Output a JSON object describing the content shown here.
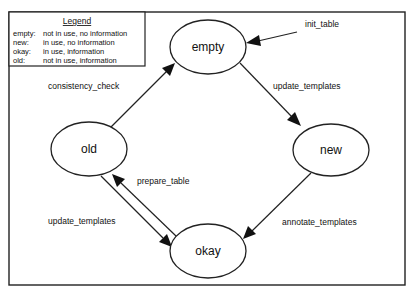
{
  "legend": {
    "title": "Legend",
    "entries": [
      {
        "key": "empty:",
        "desc": "not in use, no information"
      },
      {
        "key": "new:",
        "desc": "in use, no information"
      },
      {
        "key": "okay:",
        "desc": "in use, information"
      },
      {
        "key": "old:",
        "desc": "not in use, information"
      }
    ]
  },
  "nodes": {
    "empty": {
      "label": "empty"
    },
    "new": {
      "label": "new"
    },
    "okay": {
      "label": "okay"
    },
    "old": {
      "label": "old"
    }
  },
  "edges": {
    "init_table": {
      "label": "init_table",
      "from": "",
      "to": "empty"
    },
    "empty_to_new": {
      "label": "update_templates",
      "from": "empty",
      "to": "new"
    },
    "new_to_okay": {
      "label": "annotate_templates",
      "from": "new",
      "to": "okay"
    },
    "old_to_empty": {
      "label": "consistency_check",
      "from": "old",
      "to": "empty"
    },
    "okay_to_old": {
      "label": "prepare_table",
      "from": "okay",
      "to": "old"
    },
    "old_to_okay": {
      "label": "update_templates",
      "from": "old",
      "to": "okay"
    }
  }
}
